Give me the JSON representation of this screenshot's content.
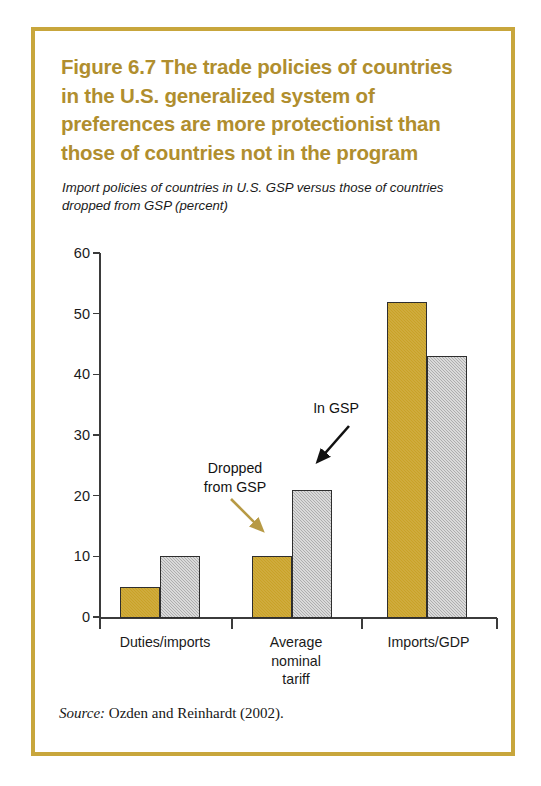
{
  "figure": {
    "number_label": "Figure 6.7",
    "title": "The trade policies of countries in the U.S. generalized system of preferences are more protectionist than those of countries not in the program",
    "title_line1": "Figure 6.7  The trade policies of countries",
    "title_line2": "in the U.S. generalized system of",
    "title_line3": "preferences are more protectionist than",
    "title_line4": "those of countries not in the program",
    "subtitle": "Import policies of countries in U.S. GSP versus those of countries dropped from GSP (percent)",
    "source_word": "Source:",
    "source_text": " Ozden and Reinhardt (2002).",
    "border_color": "#C8A63C",
    "title_color": "#B08E2E"
  },
  "chart_data": {
    "type": "bar",
    "title": "The trade policies of countries in the U.S. generalized system of preferences are more protectionist than those of countries not in the program",
    "subtitle": "Import policies of countries in U.S. GSP versus those of countries dropped from GSP (percent)",
    "categories": [
      "Duties/imports",
      "Average nominal tariff",
      "Imports/GDP"
    ],
    "category_label_lines": [
      [
        "Duties/imports"
      ],
      [
        "Average",
        "nominal",
        "tariff"
      ],
      [
        "Imports/GDP"
      ]
    ],
    "series": [
      {
        "name": "Dropped from GSP",
        "color": "#C9A227",
        "values": [
          5,
          10,
          52
        ]
      },
      {
        "name": "In GSP",
        "color": "#AEAEAE",
        "values": [
          10,
          21,
          43
        ]
      }
    ],
    "xlabel": "",
    "ylabel": "",
    "ylim": [
      0,
      60
    ],
    "yticks": [
      0,
      10,
      20,
      30,
      40,
      50,
      60
    ],
    "ytick_labels": [
      "0",
      "10",
      "20",
      "30",
      "40",
      "50",
      "60"
    ],
    "grid": false,
    "legend": "annotations-with-arrows",
    "annotations": [
      {
        "text": "Dropped from GSP",
        "lines": [
          "Dropped",
          "from GSP"
        ],
        "points_to": "category-2-gold-bar",
        "arrow_color": "#B79A45"
      },
      {
        "text": "In GSP",
        "lines": [
          "In GSP"
        ],
        "points_to": "category-2-gray-bar",
        "arrow_color": "#111111"
      }
    ]
  },
  "annotations": {
    "dropped_line1": "Dropped",
    "dropped_line2": "from GSP",
    "ingsp": "In GSP"
  }
}
